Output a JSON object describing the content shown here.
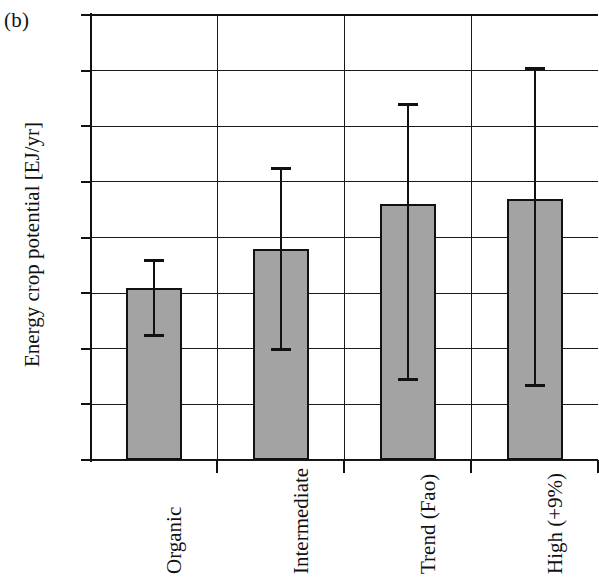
{
  "panel": {
    "label": "(b)"
  },
  "chart_data": {
    "type": "bar",
    "title": "",
    "subtitle": "",
    "xlabel": "",
    "ylabel": "Energy crop potential [EJ/yr]",
    "ylim": [
      0,
      160
    ],
    "yticks": [
      0,
      20,
      40,
      60,
      80,
      100,
      120,
      140,
      160
    ],
    "grid": "horizontal",
    "legend": "none",
    "categories": [
      "Organic",
      "Intermediate",
      "Trend (Fao)",
      "High (+9%)"
    ],
    "values": [
      62,
      76,
      92,
      94
    ],
    "error_low": [
      45,
      40,
      29,
      27
    ],
    "error_high": [
      72,
      105,
      128,
      141
    ],
    "series": [
      {
        "name": "Energy crop potential",
        "values": [
          62,
          76,
          92,
          94
        ],
        "error_low": [
          45,
          40,
          29,
          27
        ],
        "error_high": [
          72,
          105,
          128,
          141
        ]
      }
    ],
    "bar_fill_color": "#a3a3a3",
    "bar_edge_color": "#111111",
    "axis_color": "#111111"
  }
}
